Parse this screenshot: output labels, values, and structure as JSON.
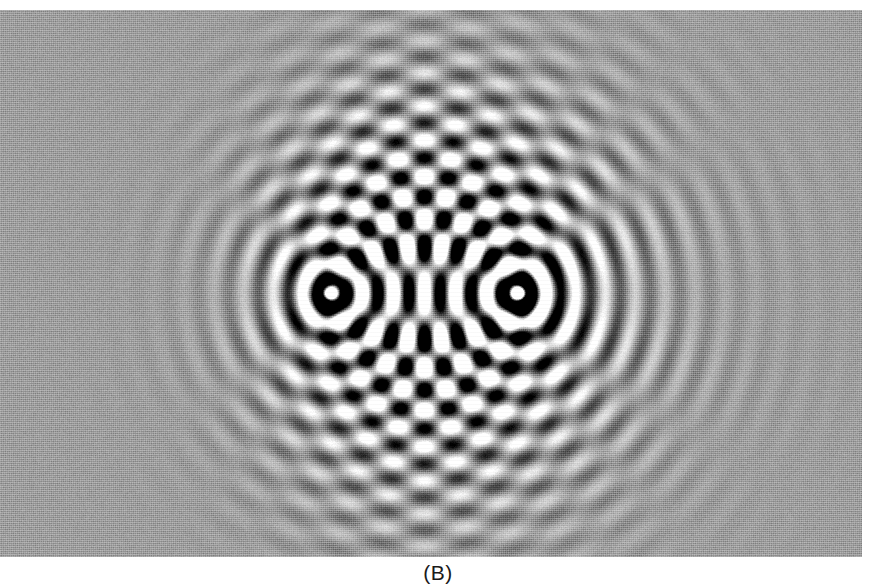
{
  "figure": {
    "caption": "(B)",
    "panel_label": "B",
    "alt_description": "Interference pattern produced by two coherent point sources",
    "colors": {
      "background": "#ffffff",
      "plate_mid_grey": "#9b9b9b",
      "crest_white": "#f2f2f2",
      "trough_black": "#2a2a2a",
      "caption_text": "#1a1a1a"
    },
    "plate": {
      "x": 0,
      "y": 10,
      "width": 862,
      "height": 547
    }
  },
  "chart_data": {
    "type": "heatmap",
    "title": "",
    "subtitle": "",
    "xlabel": "",
    "ylabel": "",
    "annotations": [
      "(B)"
    ],
    "legend": [],
    "grid": false,
    "field_model": "sum of two radial cosine waves with 1/sqrt(r) amplitude decay",
    "render": {
      "width": 862,
      "height": 547,
      "mid_level": 155,
      "amplitude_scale": 118,
      "gamma": 1.0,
      "noise_amount": 9,
      "contrast_falloff_right": 0.62,
      "contrast_falloff_left": 0.17
    },
    "axis_ranges": {
      "x": [
        0,
        862
      ],
      "y": [
        0,
        547
      ]
    },
    "sources": [
      {
        "name": "source-left",
        "x": 330,
        "y": 283,
        "phase": 0,
        "amplitude": 1.0
      },
      {
        "name": "source-right",
        "x": 518,
        "y": 283,
        "phase": 0,
        "amplitude": 1.0
      }
    ],
    "wave": {
      "wavelength_px": 30,
      "source_separation_px": 188,
      "separation_in_wavelengths": 6.27,
      "order_of_central_maximum": 0,
      "nodal_line_count": 12,
      "propagation_bias_direction": "right"
    },
    "nodal_points_on_axis_x": [
      347,
      377,
      407,
      437,
      467,
      497
    ],
    "features": [
      {
        "name": "central-bright-band",
        "x": 424,
        "orientation": "vertical"
      },
      {
        "name": "left-source-blob",
        "x": 330,
        "y": 293,
        "radius": 16
      },
      {
        "name": "right-source-blob",
        "x": 518,
        "y": 293,
        "radius": 16
      },
      {
        "name": "right-travelling-fringes",
        "x_range": [
          560,
          862
        ]
      },
      {
        "name": "left-faded-region",
        "x_range": [
          0,
          280
        ]
      }
    ]
  }
}
